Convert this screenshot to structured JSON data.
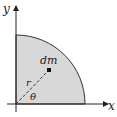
{
  "diagram": {
    "type": "quarter-disc-mass-element",
    "axes": {
      "x_label": "x",
      "y_label": "y"
    },
    "element": {
      "mass_label": "dm",
      "radius_label": "r",
      "angle_label": "θ"
    },
    "colors": {
      "fill": "#d8d8d8",
      "stroke": "#333333",
      "axis": "#222222"
    }
  }
}
